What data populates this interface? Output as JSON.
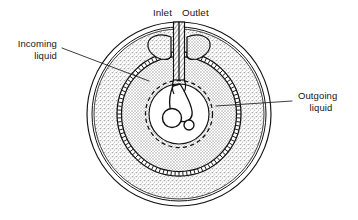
{
  "figure": {
    "labels": {
      "inlet": "Inlet",
      "outlet": "Outlet",
      "incoming_line1": "Incoming",
      "incoming_line2": "liquid",
      "outgoing_line1": "Outgoing",
      "outgoing_line2": "liquid"
    },
    "colors": {
      "line": "#111111",
      "stipple_fill": "#cfcfcf",
      "crosshatch_fill": "#dcdcdc",
      "background": "#ffffff",
      "white_core": "#ffffff"
    },
    "geometry": {
      "center_x": 179,
      "center_y": 114,
      "outer_radius_1": 92,
      "outer_radius_2": 87,
      "stipple_outer_radius": 85,
      "hatched_ring_outer_radius": 62,
      "hatched_ring_inner_radius": 58,
      "crosshatch_radius": 58,
      "dashed_circle_radius": 33,
      "core_radius": 30
    },
    "parts": [
      {
        "name": "outer-shell",
        "description": "double outline bowl wall"
      },
      {
        "name": "incoming-liquid-region",
        "description": "stippled annulus"
      },
      {
        "name": "hatched-ring",
        "description": "ladder-hatched separating ring"
      },
      {
        "name": "outgoing-liquid-region",
        "description": "cross-hatched inner disc"
      },
      {
        "name": "inlet-outlet-tube",
        "description": "hatched vertical tube at top"
      },
      {
        "name": "wing-left",
        "description": "left wedge vane"
      },
      {
        "name": "wing-right",
        "description": "right wedge vane"
      },
      {
        "name": "impeller-hook",
        "description": "curved hook shape in core"
      },
      {
        "name": "large-core-circle",
        "description": "large circle in core"
      },
      {
        "name": "small-core-circle",
        "description": "small circle in core"
      },
      {
        "name": "dashed-core-circle",
        "description": "dashed circle in core"
      }
    ]
  }
}
